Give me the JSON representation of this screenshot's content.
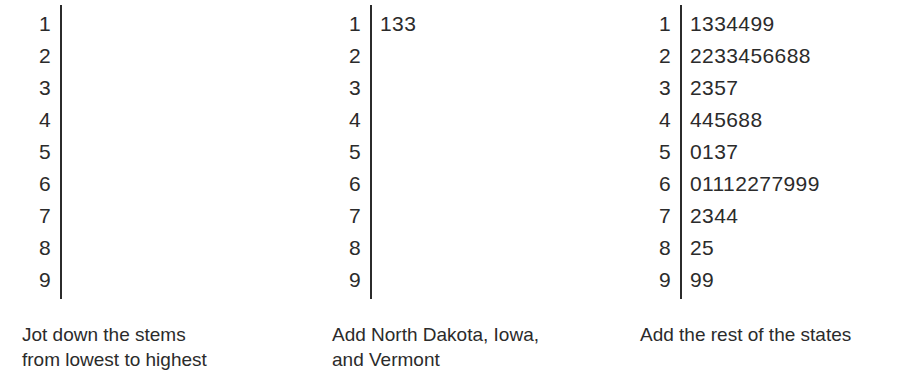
{
  "figure": {
    "kind": "stem-and-leaf-plot-sequence",
    "background_color": "#ffffff",
    "ink_color": "#2b2b2b",
    "stems": [
      "1",
      "2",
      "3",
      "4",
      "5",
      "6",
      "7",
      "8",
      "9"
    ]
  },
  "panels": [
    {
      "id": "panel-1",
      "caption_lines": [
        "Jot down the stems",
        "from lowest to highest"
      ],
      "rows": [
        {
          "stem": "1",
          "leaves": ""
        },
        {
          "stem": "2",
          "leaves": ""
        },
        {
          "stem": "3",
          "leaves": ""
        },
        {
          "stem": "4",
          "leaves": ""
        },
        {
          "stem": "5",
          "leaves": ""
        },
        {
          "stem": "6",
          "leaves": ""
        },
        {
          "stem": "7",
          "leaves": ""
        },
        {
          "stem": "8",
          "leaves": ""
        },
        {
          "stem": "9",
          "leaves": ""
        }
      ]
    },
    {
      "id": "panel-2",
      "caption_lines": [
        "Add North Dakota, Iowa,",
        "and Vermont"
      ],
      "rows": [
        {
          "stem": "1",
          "leaves": "133"
        },
        {
          "stem": "2",
          "leaves": ""
        },
        {
          "stem": "3",
          "leaves": ""
        },
        {
          "stem": "4",
          "leaves": ""
        },
        {
          "stem": "5",
          "leaves": ""
        },
        {
          "stem": "6",
          "leaves": ""
        },
        {
          "stem": "7",
          "leaves": ""
        },
        {
          "stem": "8",
          "leaves": ""
        },
        {
          "stem": "9",
          "leaves": ""
        }
      ]
    },
    {
      "id": "panel-3",
      "caption_lines": [
        "Add the rest of the states"
      ],
      "rows": [
        {
          "stem": "1",
          "leaves": "1334499"
        },
        {
          "stem": "2",
          "leaves": "2233456688"
        },
        {
          "stem": "3",
          "leaves": "2357"
        },
        {
          "stem": "4",
          "leaves": "445688"
        },
        {
          "stem": "5",
          "leaves": "0137"
        },
        {
          "stem": "6",
          "leaves": "01112277999"
        },
        {
          "stem": "7",
          "leaves": "2344"
        },
        {
          "stem": "8",
          "leaves": "25"
        },
        {
          "stem": "9",
          "leaves": "99"
        }
      ]
    }
  ],
  "chart_data": {
    "type": "table",
    "title": "",
    "subtitle": "",
    "xlabel": "",
    "ylabel": "",
    "stages": [
      {
        "name": "Jot down the stems from lowest to highest",
        "stems": [
          "1",
          "2",
          "3",
          "4",
          "5",
          "6",
          "7",
          "8",
          "9"
        ],
        "leaves": [
          [],
          [],
          [],
          [],
          [],
          [],
          [],
          [],
          []
        ]
      },
      {
        "name": "Add North Dakota, Iowa, and Vermont",
        "stems": [
          "1",
          "2",
          "3",
          "4",
          "5",
          "6",
          "7",
          "8",
          "9"
        ],
        "leaves": [
          [
            1,
            3,
            3
          ],
          [],
          [],
          [],
          [],
          [],
          [],
          [],
          []
        ]
      },
      {
        "name": "Add the rest of the states",
        "stems": [
          "1",
          "2",
          "3",
          "4",
          "5",
          "6",
          "7",
          "8",
          "9"
        ],
        "leaves": [
          [
            1,
            3,
            3,
            4,
            4,
            9,
            9
          ],
          [
            2,
            2,
            3,
            3,
            4,
            5,
            6,
            6,
            8,
            8
          ],
          [
            2,
            3,
            5,
            7
          ],
          [
            4,
            4,
            5,
            6,
            8,
            8
          ],
          [
            0,
            1,
            3,
            7
          ],
          [
            0,
            1,
            1,
            1,
            2,
            2,
            7,
            7,
            9,
            9,
            9
          ],
          [
            2,
            3,
            4,
            4
          ],
          [
            2,
            5
          ],
          [
            9,
            9
          ]
        ],
        "values": [
          11,
          13,
          13,
          14,
          14,
          19,
          19,
          22,
          22,
          23,
          23,
          24,
          25,
          26,
          26,
          28,
          28,
          32,
          33,
          35,
          37,
          44,
          44,
          45,
          46,
          48,
          48,
          50,
          51,
          53,
          57,
          60,
          61,
          61,
          61,
          62,
          62,
          67,
          67,
          69,
          69,
          69,
          72,
          73,
          74,
          74,
          82,
          85,
          99,
          99
        ],
        "count": 50
      }
    ]
  }
}
